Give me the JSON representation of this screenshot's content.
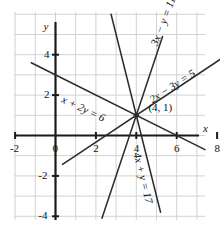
{
  "figure": {
    "name": "four-line-system-graph",
    "background_color": "#ffffff",
    "grid_color": "#d2d2d2",
    "axis_color": "#1a1a1a",
    "line_color": "#2b2b2b",
    "text_color": "#111111"
  },
  "chart_data": {
    "type": "line",
    "title": "",
    "xlabel": "x",
    "ylabel": "y",
    "grid": true,
    "legend": "none",
    "xlim": [
      -3,
      9
    ],
    "ylim": [
      -5,
      5
    ],
    "xticks": [
      "-2",
      "0",
      "2",
      "4",
      "6",
      "8"
    ],
    "xtick_values": [
      -2,
      0,
      2,
      4,
      6,
      8
    ],
    "yticks": [
      "4",
      "2",
      "0",
      "-2",
      "-4"
    ],
    "ytick_values": [
      4,
      2,
      0,
      -2,
      -4
    ],
    "series": [
      {
        "name": "x + 2y = 6",
        "label": "x + 2y = 6",
        "slope": -0.5,
        "intercept": 3,
        "x_start": -1.2,
        "x_end": 7.4,
        "label_x": 0.45,
        "label_y": 2.1,
        "label_rotation": 25
      },
      {
        "name": "3x - y = 11",
        "label": "3x − y = 11",
        "slope": 3,
        "intercept": -11,
        "x_start": 2.3,
        "x_end": 5.3,
        "label_x": 4.6,
        "label_y": 4.6,
        "label_rotation": -69
      },
      {
        "name": "2x - 3y = 5",
        "label": "2x − 3y = 5",
        "slope": 0.6667,
        "intercept": -1.6667,
        "x_start": 0.35,
        "x_end": 8.9,
        "label_x": 4.55,
        "label_y": 2.0,
        "label_rotation": -33
      },
      {
        "name": "4x + y = 17",
        "label": "4x + y = 17",
        "slope": -4,
        "intercept": 17,
        "x_start": 2.75,
        "x_end": 5.2,
        "label_x": 4.35,
        "label_y": -0.75,
        "label_rotation": 76
      }
    ],
    "annotations": [
      {
        "name": "intersection-point",
        "label": "(4, 1)",
        "x": 4,
        "y": 1,
        "label_x": 4.6,
        "label_y": 1.35,
        "marker": true
      }
    ]
  }
}
